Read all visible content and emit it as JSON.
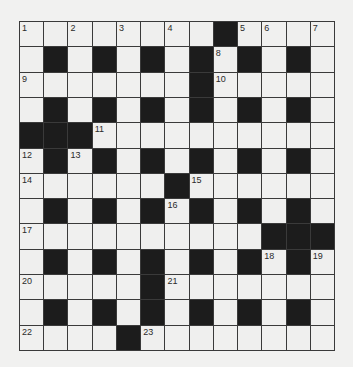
{
  "puzzle": {
    "type": "crossword",
    "rows": 13,
    "cols": 13,
    "colors": {
      "background": "#f1f1f0",
      "white_cell": "#efefee",
      "black_cell": "#1c1c1c",
      "grid_line": "#3a3a3a",
      "number": "#2a2a2a"
    },
    "grid": [
      "WWWWWWWWBWWWW",
      "WBWBWBWBWBWBW",
      "WWWWWWWBWWWWW",
      "WBWBWBWBWBWBW",
      "BBBWWWWWWWWWW",
      "WBWBWBWBWBWBW",
      "WWWWWWBWWWWWW",
      "WBWBWBWBWBWBW",
      "WWWWWWWWWWBBB",
      "WBWBWBWBWBWBW",
      "WWWWWBWWWWWWW",
      "WBWBWBWBWBWBW",
      "WWWWBWWWWWWWW"
    ],
    "numbers": [
      {
        "row": 0,
        "col": 0,
        "n": "1"
      },
      {
        "row": 0,
        "col": 2,
        "n": "2"
      },
      {
        "row": 0,
        "col": 4,
        "n": "3"
      },
      {
        "row": 0,
        "col": 6,
        "n": "4"
      },
      {
        "row": 0,
        "col": 9,
        "n": "5"
      },
      {
        "row": 0,
        "col": 10,
        "n": "6"
      },
      {
        "row": 0,
        "col": 12,
        "n": "7"
      },
      {
        "row": 1,
        "col": 8,
        "n": "8"
      },
      {
        "row": 2,
        "col": 0,
        "n": "9"
      },
      {
        "row": 2,
        "col": 8,
        "n": "10"
      },
      {
        "row": 4,
        "col": 3,
        "n": "11"
      },
      {
        "row": 5,
        "col": 0,
        "n": "12"
      },
      {
        "row": 5,
        "col": 2,
        "n": "13"
      },
      {
        "row": 6,
        "col": 0,
        "n": "14"
      },
      {
        "row": 6,
        "col": 7,
        "n": "15"
      },
      {
        "row": 7,
        "col": 6,
        "n": "16"
      },
      {
        "row": 8,
        "col": 0,
        "n": "17"
      },
      {
        "row": 9,
        "col": 10,
        "n": "18"
      },
      {
        "row": 9,
        "col": 12,
        "n": "19"
      },
      {
        "row": 10,
        "col": 0,
        "n": "20"
      },
      {
        "row": 10,
        "col": 6,
        "n": "21"
      },
      {
        "row": 12,
        "col": 0,
        "n": "22"
      },
      {
        "row": 12,
        "col": 5,
        "n": "23"
      }
    ],
    "entries": []
  }
}
